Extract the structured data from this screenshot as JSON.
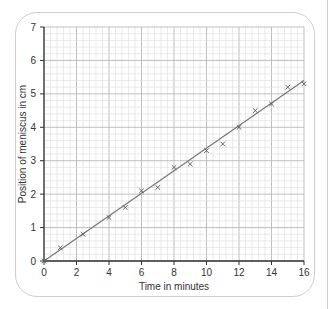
{
  "chart_data": {
    "type": "scatter",
    "title": "",
    "xlabel": "Time in minutes",
    "ylabel": "Position of meniscus in cm",
    "xlim": [
      0,
      16
    ],
    "ylim": [
      0,
      7
    ],
    "x_ticks": [
      0,
      2,
      4,
      6,
      8,
      10,
      12,
      14,
      16
    ],
    "y_ticks": [
      0,
      1,
      2,
      3,
      4,
      5,
      6,
      7
    ],
    "grid": true,
    "marker": "x",
    "points": [
      {
        "x": 0,
        "y": 0
      },
      {
        "x": 1,
        "y": 0.4
      },
      {
        "x": 2.4,
        "y": 0.8
      },
      {
        "x": 4,
        "y": 1.3
      },
      {
        "x": 5,
        "y": 1.6
      },
      {
        "x": 6,
        "y": 2.1
      },
      {
        "x": 7,
        "y": 2.2
      },
      {
        "x": 8,
        "y": 2.8
      },
      {
        "x": 9,
        "y": 2.9
      },
      {
        "x": 10,
        "y": 3.3
      },
      {
        "x": 11,
        "y": 3.5
      },
      {
        "x": 12,
        "y": 4.0
      },
      {
        "x": 13,
        "y": 4.5
      },
      {
        "x": 14,
        "y": 4.7
      },
      {
        "x": 15,
        "y": 5.2
      },
      {
        "x": 16,
        "y": 5.3
      }
    ],
    "best_fit_line": {
      "x": [
        0,
        16
      ],
      "y": [
        0,
        5.4
      ]
    }
  },
  "colors": {
    "grid_minor": "#dcdcdc",
    "grid_major": "#b8b8b8",
    "axis": "#333333",
    "line": "#777777",
    "marker": "#555555"
  }
}
